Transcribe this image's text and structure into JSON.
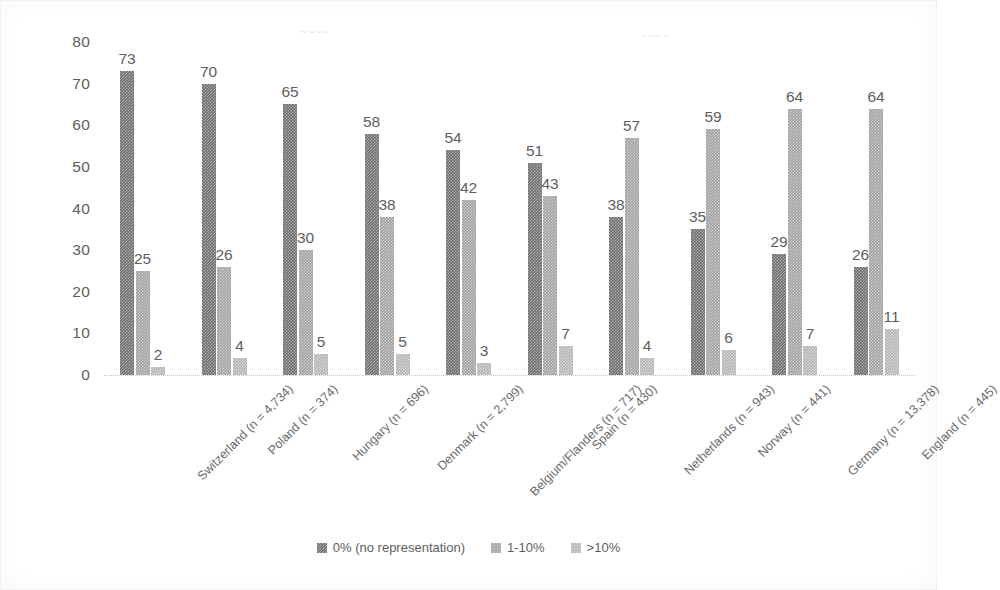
{
  "chart_data": {
    "type": "bar",
    "title": "",
    "subtitle": "",
    "xlabel": "",
    "ylabel": "",
    "ylim": [
      0,
      80
    ],
    "yticks": [
      0,
      10,
      20,
      30,
      40,
      50,
      60,
      70,
      80
    ],
    "grid": false,
    "legend_position": "bottom",
    "categories": [
      "Switzerland (n = 4,734)",
      "Poland (n = 374)",
      "Hungary (n = 696)",
      "Denmark (n = 2,799)",
      "Belgium/Flanders (n = 717)",
      "Spain (n = 430)",
      "Netherlands (n = 943)",
      "Norway (n = 441)",
      "Germany (n = 13,378)",
      "England (n = 445)"
    ],
    "series": [
      {
        "name": "0% (no representation)",
        "color": "#6e6e6e",
        "values": [
          73,
          70,
          65,
          58,
          54,
          51,
          38,
          35,
          29,
          26
        ]
      },
      {
        "name": "1-10%",
        "color": "#a0a0a0",
        "values": [
          25,
          26,
          30,
          38,
          42,
          43,
          57,
          59,
          64,
          64
        ]
      },
      {
        "name": ">10%",
        "color": "#b2b2b2",
        "values": [
          2,
          4,
          5,
          5,
          3,
          7,
          4,
          6,
          7,
          11
        ]
      }
    ]
  },
  "legend": {
    "items": [
      {
        "label": "0% (no representation)",
        "series_index": 0
      },
      {
        "label": "1-10%",
        "series_index": 1
      },
      {
        "label": ">10%",
        "series_index": 2
      }
    ]
  },
  "scan_artifacts": {
    "top_left_smudge": "~~~~",
    "top_right_smudge": "~~~~"
  }
}
